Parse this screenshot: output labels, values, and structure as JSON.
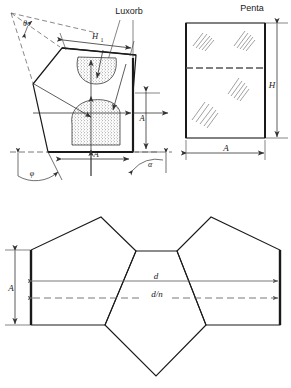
{
  "page": {
    "background": "#ffffff",
    "line_color": "#1a1a1a",
    "dim_color": "#555555"
  },
  "labels": {
    "penta": "Penta",
    "luxorb": "Luxorb",
    "h1": "H",
    "h1_sub": "1",
    "theta": "θ",
    "phi": "φ",
    "alpha": "α",
    "a_vert_left": "A",
    "a_horiz_left": "A",
    "h_right": "H",
    "a_right": "A",
    "a_bottom": "A",
    "d": "d",
    "d_over_n": "d/n"
  },
  "figures": {
    "top_left": {
      "name": "penta-prism-section",
      "caption_items": [
        "Luxorb",
        "H",
        "A",
        "θ",
        "φ",
        "α"
      ],
      "description": "Tilted pentagonal prism cross-section with light ray arrows and two stippled Luxorb absorber regions"
    },
    "top_right": {
      "name": "penta-prism-face",
      "caption_items": [
        "Penta",
        "H",
        "A"
      ],
      "description": "Rectangular front face of penta prism with scratch hatch marks and dashed centre line"
    },
    "bottom": {
      "name": "penta-prism-unfolded",
      "caption_items": [
        "A",
        "d",
        "d/n"
      ],
      "description": "Three pentagons unfolded showing optical path length d and reduced path d/n"
    }
  }
}
